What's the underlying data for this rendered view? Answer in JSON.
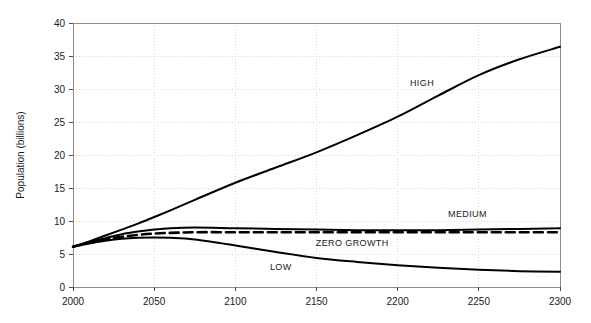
{
  "chart_data": {
    "type": "line",
    "title": "",
    "xlabel": "",
    "ylabel": "Population (billions)",
    "xlim": [
      2000,
      2300
    ],
    "ylim": [
      0,
      40
    ],
    "grid": true,
    "legend_position": "inline-labels",
    "xticks": [
      2000,
      2050,
      2100,
      2150,
      2200,
      2250,
      2300
    ],
    "yticks": [
      0,
      5,
      10,
      15,
      20,
      25,
      30,
      35,
      40
    ],
    "xtick_labels": [
      "2000",
      "2050",
      "2100",
      "2150",
      "2200",
      "2250",
      "2300"
    ],
    "ytick_labels": [
      "0",
      "5",
      "10",
      "15",
      "20",
      "25",
      "30",
      "35",
      "40"
    ],
    "x": [
      2000,
      2010,
      2020,
      2030,
      2040,
      2050,
      2060,
      2075,
      2100,
      2125,
      2150,
      2175,
      2200,
      2225,
      2250,
      2275,
      2300
    ],
    "series": [
      {
        "name": "HIGH",
        "label": "HIGH",
        "style": "solid",
        "color": "#000000",
        "label_x": 2215,
        "label_y": 30.4,
        "values": [
          6.1,
          6.9,
          7.8,
          8.7,
          9.6,
          10.6,
          11.6,
          13.2,
          15.8,
          18.1,
          20.4,
          23.0,
          25.8,
          29.0,
          32.1,
          34.5,
          36.4
        ]
      },
      {
        "name": "MEDIUM",
        "label": "MEDIUM",
        "style": "solid",
        "color": "#000000",
        "label_x": 2243,
        "label_y": 10.6,
        "values": [
          6.1,
          6.8,
          7.4,
          8.0,
          8.4,
          8.7,
          8.9,
          9.0,
          8.9,
          8.8,
          8.7,
          8.6,
          8.6,
          8.6,
          8.7,
          8.8,
          8.9
        ]
      },
      {
        "name": "ZERO GROWTH",
        "label": "ZERO GROWTH",
        "style": "dashed",
        "color": "#000000",
        "label_x": 2172,
        "label_y": 6.2,
        "values": [
          6.1,
          6.7,
          7.2,
          7.6,
          7.9,
          8.1,
          8.2,
          8.3,
          8.3,
          8.3,
          8.3,
          8.3,
          8.3,
          8.3,
          8.3,
          8.3,
          8.3
        ]
      },
      {
        "name": "LOW",
        "label": "LOW",
        "style": "solid",
        "color": "#000000",
        "label_x": 2128,
        "label_y": 2.6,
        "values": [
          6.1,
          6.6,
          7.0,
          7.3,
          7.45,
          7.5,
          7.45,
          7.2,
          6.3,
          5.3,
          4.4,
          3.8,
          3.3,
          2.9,
          2.6,
          2.4,
          2.3
        ]
      }
    ]
  }
}
